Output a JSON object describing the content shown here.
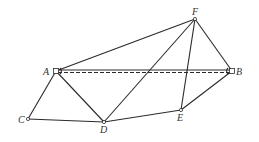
{
  "diagram": {
    "type": "geometry-figure",
    "points": [
      {
        "id": "A",
        "label": "A",
        "x": 56,
        "y": 71,
        "lx": 43,
        "ly": 75
      },
      {
        "id": "B",
        "label": "B",
        "x": 232,
        "y": 71,
        "lx": 236,
        "ly": 75
      },
      {
        "id": "C",
        "label": "C",
        "x": 28,
        "y": 119,
        "lx": 18,
        "ly": 123
      },
      {
        "id": "D",
        "label": "D",
        "x": 104,
        "y": 122,
        "lx": 100,
        "ly": 133
      },
      {
        "id": "E",
        "label": "E",
        "x": 181,
        "y": 110,
        "lx": 177,
        "ly": 121
      },
      {
        "id": "F",
        "label": "F",
        "x": 195,
        "y": 19,
        "lx": 192,
        "ly": 15
      }
    ],
    "segments": [
      {
        "from": "A",
        "to": "F",
        "style": "solid"
      },
      {
        "from": "F",
        "to": "B",
        "style": "solid"
      },
      {
        "from": "F",
        "to": "D",
        "style": "solid"
      },
      {
        "from": "F",
        "to": "E",
        "style": "solid"
      },
      {
        "from": "A",
        "to": "B",
        "style": "solid"
      },
      {
        "from": "A",
        "to": "B",
        "style": "dashed"
      },
      {
        "from": "A",
        "to": "C",
        "style": "solid"
      },
      {
        "from": "A",
        "to": "D",
        "style": "solid"
      },
      {
        "from": "C",
        "to": "D",
        "style": "solid"
      },
      {
        "from": "D",
        "to": "E",
        "style": "solid"
      },
      {
        "from": "E",
        "to": "B",
        "style": "solid"
      }
    ],
    "labels": {
      "A": "A",
      "B": "B",
      "C": "C",
      "D": "D",
      "E": "E",
      "F": "F"
    },
    "colors": {
      "stroke": "#2a2a2a",
      "background": "#ffffff"
    }
  }
}
